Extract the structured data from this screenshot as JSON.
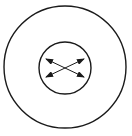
{
  "diagram": {
    "type": "concentric-circles-with-crossed-arrows",
    "colors": {
      "stroke": "#1a1a1a",
      "background": "#ffffff"
    },
    "outer_circle": {
      "cx": 65,
      "cy": 67,
      "r": 61
    },
    "inner_circle": {
      "cx": 65,
      "cy": 68,
      "r": 26
    },
    "arrows": [
      {
        "name": "arrow-upper-left-to-lower-right",
        "x1": 46,
        "y1": 59,
        "x2": 84,
        "y2": 77,
        "heads": "both"
      },
      {
        "name": "arrow-lower-left-to-upper-right",
        "x1": 46,
        "y1": 77,
        "x2": 84,
        "y2": 59,
        "heads": "both"
      }
    ]
  }
}
